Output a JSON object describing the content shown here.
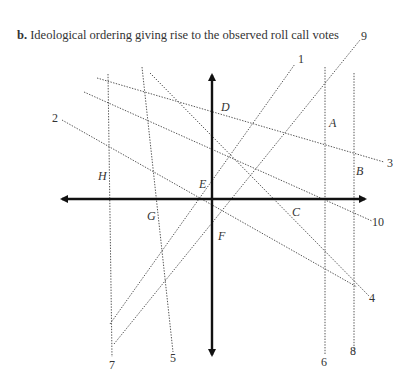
{
  "caption": {
    "label": "b.",
    "text": "Ideological ordering giving rise to the observed roll call votes"
  },
  "diagram": {
    "type": "spatial-voting-cutting-lines",
    "axes": {
      "origin": [
        212,
        199
      ],
      "x_axis": {
        "from": [
          62,
          199
        ],
        "to": [
          365,
          199
        ],
        "arrows": "both"
      },
      "y_axis": {
        "from": [
          212,
          75
        ],
        "to": [
          212,
          355
        ],
        "arrows": "both"
      }
    },
    "cutting_lines": [
      {
        "id": "1",
        "label": "1",
        "x1": 110,
        "y1": 324,
        "x2": 295,
        "y2": 64,
        "label_x": 298,
        "label_y": 63
      },
      {
        "id": "2",
        "label": "2",
        "x1": 62,
        "y1": 120,
        "x2": 357,
        "y2": 287,
        "label_x": 52,
        "label_y": 122
      },
      {
        "id": "3",
        "label": "3",
        "x1": 97,
        "y1": 78,
        "x2": 384,
        "y2": 162,
        "label_x": 387,
        "label_y": 167
      },
      {
        "id": "4",
        "label": "4",
        "x1": 150,
        "y1": 73,
        "x2": 369,
        "y2": 296,
        "label_x": 369,
        "label_y": 302
      },
      {
        "id": "5",
        "label": "5",
        "x1": 142,
        "y1": 67,
        "x2": 173,
        "y2": 352,
        "label_x": 170,
        "label_y": 362
      },
      {
        "id": "6",
        "label": "6",
        "x1": 325,
        "y1": 67,
        "x2": 325,
        "y2": 355,
        "label_x": 321,
        "label_y": 366
      },
      {
        "id": "7",
        "label": "7",
        "x1": 108,
        "y1": 74,
        "x2": 112,
        "y2": 357,
        "label_x": 109,
        "label_y": 369
      },
      {
        "id": "8",
        "label": "8",
        "x1": 354,
        "y1": 73,
        "x2": 354,
        "y2": 352,
        "label_x": 350,
        "label_y": 355
      },
      {
        "id": "9",
        "label": "9",
        "x1": 114,
        "y1": 344,
        "x2": 360,
        "y2": 40,
        "label_x": 361,
        "label_y": 40
      },
      {
        "id": "10",
        "label": "10",
        "x1": 84,
        "y1": 92,
        "x2": 372,
        "y2": 221,
        "label_x": 372,
        "label_y": 226
      }
    ],
    "points": [
      {
        "id": "A",
        "label": "A",
        "x": 329,
        "y": 127
      },
      {
        "id": "B",
        "label": "B",
        "x": 356,
        "y": 175
      },
      {
        "id": "C",
        "label": "C",
        "x": 292,
        "y": 216
      },
      {
        "id": "D",
        "label": "D",
        "x": 221,
        "y": 111
      },
      {
        "id": "E",
        "label": "E",
        "x": 199,
        "y": 188
      },
      {
        "id": "F",
        "label": "F",
        "x": 218,
        "y": 240
      },
      {
        "id": "G",
        "label": "G",
        "x": 147,
        "y": 220
      },
      {
        "id": "H",
        "label": "H",
        "x": 98,
        "y": 180
      }
    ]
  }
}
